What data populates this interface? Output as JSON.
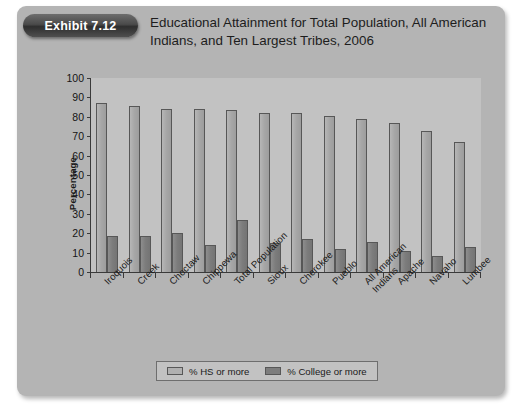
{
  "exhibit": {
    "badge_label": "Exhibit 7.12",
    "title": "Educational Attainment for Total Population, All American Indians, and Ten Largest Tribes, 2006"
  },
  "chart_data": {
    "type": "bar",
    "title": "Educational Attainment for Total Population, All American Indians, and Ten Largest Tribes, 2006",
    "xlabel": "",
    "ylabel": "Percentage",
    "ylim": [
      0,
      100
    ],
    "ytick_labels": [
      "0",
      "10",
      "20",
      "30",
      "40",
      "50",
      "60",
      "70",
      "80",
      "90",
      "100"
    ],
    "ytick_values": [
      0,
      10,
      20,
      30,
      40,
      50,
      60,
      70,
      80,
      90,
      100
    ],
    "grid": false,
    "legend_position": "bottom",
    "categories": [
      "Iroquois",
      "Creek",
      "Choctaw",
      "Chippewa",
      "Total Population",
      "Sioux",
      "Cherokee",
      "Pueblo",
      "All American Indians",
      "Apache",
      "Navaho",
      "Lumbee"
    ],
    "series": [
      {
        "name": "% HS or more",
        "color": "#a6a6a6",
        "values": [
          87,
          85.5,
          84,
          84,
          83.5,
          82,
          82,
          80.5,
          79,
          77,
          72.5,
          67
        ]
      },
      {
        "name": "% College or more",
        "color": "#7c7c7c",
        "values": [
          18.5,
          18.5,
          20,
          14,
          27,
          15,
          17,
          12,
          15.5,
          11,
          8,
          13
        ]
      }
    ]
  }
}
